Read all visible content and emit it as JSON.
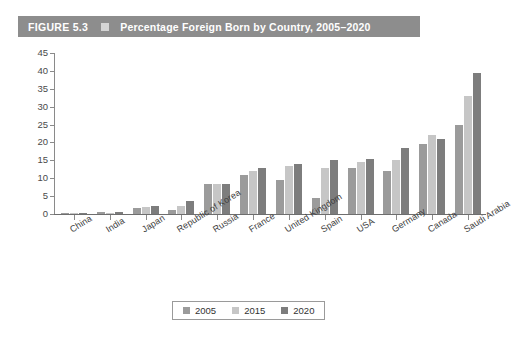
{
  "figure": {
    "number_label": "FIGURE 5.3",
    "title": "Percentage Foreign Born by Country, 2005–2020",
    "marker_icon": "square-marker-icon",
    "header_bg": "#8d8d8d",
    "header_text_color": "#ffffff"
  },
  "legend": {
    "position": "bottom-center",
    "entries": [
      {
        "label": "2005",
        "color": "#9b9b9b",
        "swatch_icon": "square-swatch-icon"
      },
      {
        "label": "2015",
        "color": "#c6c6c6",
        "swatch_icon": "square-swatch-icon"
      },
      {
        "label": "2020",
        "color": "#7d7d7d",
        "swatch_icon": "square-swatch-icon"
      }
    ]
  },
  "axes": {
    "y_ticks": [
      "0",
      "5",
      "10",
      "15",
      "20",
      "25",
      "30",
      "35",
      "40",
      "45"
    ],
    "y_min": 0,
    "y_max": 45,
    "y_step": 5,
    "x_categories": [
      "China",
      "India",
      "Japan",
      "Republic of Korea",
      "Russia",
      "France",
      "United Kingdom",
      "Spain",
      "USA",
      "Germany",
      "Canada",
      "Saudi Arabia"
    ]
  },
  "chart_data": {
    "type": "bar",
    "title": "Percentage Foreign Born by Country, 2005–2020",
    "xlabel": "",
    "ylabel": "",
    "ylim": [
      0,
      45
    ],
    "ytick_step": 5,
    "grid": false,
    "legend_position": "bottom-center",
    "categories": [
      "China",
      "India",
      "Japan",
      "Republic of Korea",
      "Russia",
      "France",
      "United Kingdom",
      "Spain",
      "USA",
      "Germany",
      "Canada",
      "Saudi Arabia"
    ],
    "series": [
      {
        "name": "2005",
        "color": "#9b9b9b",
        "values": [
          0.1,
          0.5,
          1.6,
          1.1,
          8.5,
          11.0,
          9.5,
          4.5,
          13.0,
          12.0,
          19.5,
          25.0
        ]
      },
      {
        "name": "2015",
        "color": "#c6c6c6",
        "values": [
          0.1,
          0.4,
          1.9,
          2.3,
          8.5,
          12.0,
          13.5,
          13.0,
          14.5,
          15.0,
          22.0,
          33.0
        ]
      },
      {
        "name": "2020",
        "color": "#7d7d7d",
        "values": [
          0.1,
          0.5,
          2.3,
          3.5,
          8.5,
          13.0,
          14.0,
          15.0,
          15.5,
          18.5,
          21.0,
          39.5
        ]
      }
    ]
  }
}
